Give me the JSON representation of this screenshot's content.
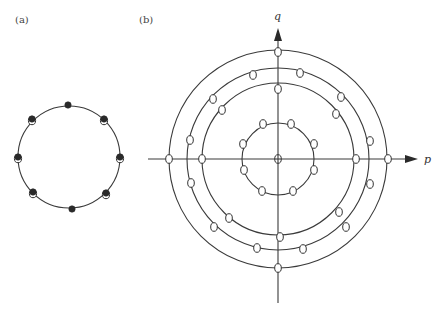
{
  "panels": [
    {
      "label": "(a)",
      "circle": {
        "cx": 69,
        "cy": 157,
        "r": 51
      },
      "points": [
        {
          "x": 68,
          "y": 105,
          "style": "filled"
        },
        {
          "x": 104,
          "y": 119,
          "style": "filled-over-open"
        },
        {
          "x": 120,
          "y": 157,
          "style": "filled-over-open"
        },
        {
          "x": 106,
          "y": 193,
          "style": "filled-over-open"
        },
        {
          "x": 72,
          "y": 209,
          "style": "filled"
        },
        {
          "x": 33,
          "y": 192,
          "style": "filled-over-open"
        },
        {
          "x": 18,
          "y": 157,
          "style": "filled-over-open"
        },
        {
          "x": 32,
          "y": 119,
          "style": "filled-over-open"
        }
      ]
    },
    {
      "label": "(b)",
      "axes": {
        "x_label": "p",
        "y_label": "q",
        "origin": {
          "x": 278,
          "y": 159
        }
      },
      "circles": [
        {
          "name": "small",
          "r": 36
        },
        {
          "name": "inner",
          "r": 76
        },
        {
          "name": "middle",
          "r": 91
        },
        {
          "name": "outer",
          "r": 109
        }
      ],
      "points": [
        {
          "x": 278,
          "y": 159,
          "circle": "center"
        },
        {
          "x": 263,
          "y": 124,
          "circle": "small"
        },
        {
          "x": 291,
          "y": 124,
          "circle": "small"
        },
        {
          "x": 243,
          "y": 144,
          "circle": "small"
        },
        {
          "x": 314,
          "y": 144,
          "circle": "small"
        },
        {
          "x": 244,
          "y": 170,
          "circle": "small"
        },
        {
          "x": 314,
          "y": 170,
          "circle": "small"
        },
        {
          "x": 262,
          "y": 191,
          "circle": "small"
        },
        {
          "x": 293,
          "y": 191,
          "circle": "small"
        },
        {
          "x": 278,
          "y": 89,
          "circle": "inner"
        },
        {
          "x": 222,
          "y": 110,
          "circle": "inner"
        },
        {
          "x": 336,
          "y": 114,
          "circle": "inner"
        },
        {
          "x": 202,
          "y": 159,
          "circle": "inner"
        },
        {
          "x": 356,
          "y": 159,
          "circle": "inner"
        },
        {
          "x": 229,
          "y": 218,
          "circle": "inner"
        },
        {
          "x": 339,
          "y": 212,
          "circle": "inner"
        },
        {
          "x": 280,
          "y": 237,
          "circle": "inner"
        },
        {
          "x": 253,
          "y": 75,
          "circle": "middle"
        },
        {
          "x": 300,
          "y": 73,
          "circle": "middle"
        },
        {
          "x": 213,
          "y": 99,
          "circle": "middle"
        },
        {
          "x": 341,
          "y": 97,
          "circle": "middle"
        },
        {
          "x": 190,
          "y": 140,
          "circle": "middle"
        },
        {
          "x": 370,
          "y": 141,
          "circle": "middle"
        },
        {
          "x": 191,
          "y": 183,
          "circle": "middle"
        },
        {
          "x": 370,
          "y": 184,
          "circle": "middle"
        },
        {
          "x": 214,
          "y": 227,
          "circle": "middle"
        },
        {
          "x": 346,
          "y": 227,
          "circle": "middle"
        },
        {
          "x": 257,
          "y": 248,
          "circle": "middle"
        },
        {
          "x": 303,
          "y": 249,
          "circle": "middle"
        },
        {
          "x": 278,
          "y": 52,
          "circle": "outer"
        },
        {
          "x": 169,
          "y": 159,
          "circle": "outer"
        },
        {
          "x": 388,
          "y": 159,
          "circle": "outer"
        },
        {
          "x": 278,
          "y": 268,
          "circle": "outer"
        }
      ]
    }
  ]
}
